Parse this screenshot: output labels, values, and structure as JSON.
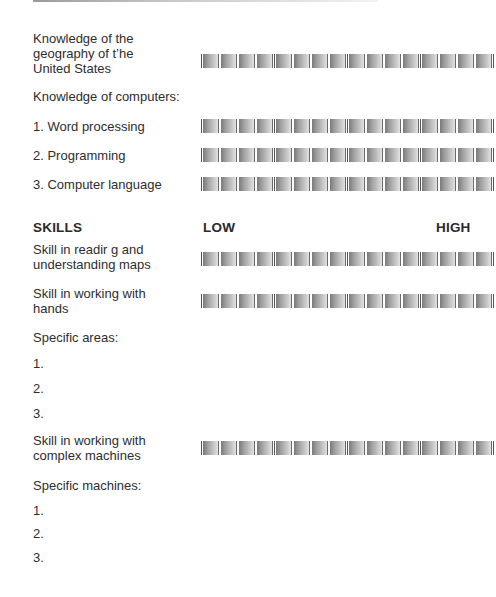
{
  "header_line": true,
  "knowledge": {
    "geography_label_lines": [
      "Knowledge of the",
      "geography of t’he",
      "United States"
    ],
    "computers_heading": "Knowledge of computers:",
    "computer_items": [
      "1. Word processing",
      "2. Programming",
      "3. Computer language"
    ]
  },
  "skills": {
    "heading": "SKILLS",
    "scale_low": "LOW",
    "scale_high": "HIGH",
    "maps_label_lines": [
      "Skill in readir g and",
      "understanding maps"
    ],
    "hands_label_lines": [
      "Skill in working with",
      "hands"
    ],
    "specific_areas_heading": "Specific areas:",
    "specific_areas": [
      "1.",
      "2.",
      "3."
    ],
    "machines_label_lines": [
      "Skill in working with",
      "complex machines"
    ],
    "specific_machines_heading": "Specific machines:",
    "specific_machines": [
      "1.",
      "2.",
      "3."
    ]
  },
  "rating_scale": {
    "cells": 16,
    "groups": 4,
    "cells_per_group": 4
  }
}
